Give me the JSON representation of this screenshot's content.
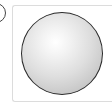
{
  "figure": {
    "label": "a",
    "shape": "sphere",
    "colors": {
      "card_border": "#dcdcdc",
      "sphere_outline": "#2a2a2a",
      "sphere_highlight": "#ffffff",
      "sphere_shadow": "#b4b4b4",
      "badge_border": "#444444"
    }
  }
}
